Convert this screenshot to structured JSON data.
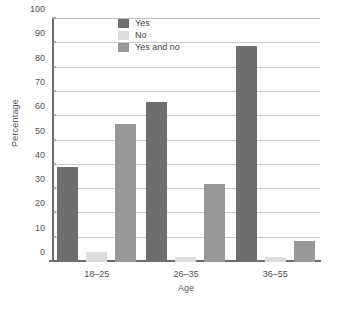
{
  "chart_data": {
    "type": "bar",
    "title": "",
    "xlabel": "Age",
    "ylabel": "Percentage",
    "categories": [
      "18–25",
      "26–35",
      "36–55"
    ],
    "series": [
      {
        "name": "Yes",
        "color": "#6e6e6e",
        "values": [
          39,
          66,
          89
        ]
      },
      {
        "name": "No",
        "color": "#dcdcdc",
        "values": [
          4,
          2,
          2
        ]
      },
      {
        "name": "Yes and no",
        "color": "#989898",
        "values": [
          57,
          32,
          8.5
        ]
      }
    ],
    "ylim": [
      0,
      100
    ],
    "yticks": [
      0,
      10,
      20,
      30,
      40,
      50,
      60,
      70,
      80,
      90,
      100
    ],
    "ytick_labels": [
      "0",
      "10",
      "20",
      "30",
      "40",
      "50",
      "60",
      "70",
      "80",
      "90",
      "100"
    ],
    "grid": true,
    "grid_axis": "y",
    "legend_position": "top-center",
    "bar_group_order": [
      "Yes",
      "No",
      "Yes and no"
    ]
  },
  "legend": {
    "items": [
      {
        "label": "Yes"
      },
      {
        "label": "No"
      },
      {
        "label": "Yes and no"
      }
    ]
  },
  "axes": {
    "y_title": "Percentage",
    "x_title": "Age"
  }
}
